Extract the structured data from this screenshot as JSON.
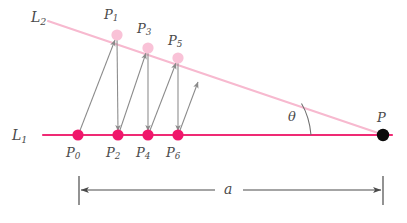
{
  "figure": {
    "background_color": "#ffffff"
  },
  "lines": {
    "baseline": {
      "name": "L",
      "subscript": "1",
      "label": "L",
      "color": "#e8266d",
      "description": "horizontal lower line"
    },
    "slant": {
      "name": "L",
      "subscript": "2",
      "label": "L",
      "color": "#f7b9cf",
      "description": "upper slanted line converging at P"
    }
  },
  "angle": {
    "label": "θ",
    "description": "angle between L1 and L2 at vertex P"
  },
  "vertex": {
    "label": "P",
    "color": "#000000"
  },
  "dimension": {
    "label": "a",
    "description": "distance from P0 to P along the baseline"
  },
  "points_lower": [
    {
      "label": "P",
      "subscript": "0",
      "x": 78,
      "y": 135,
      "color": "#f0176b"
    },
    {
      "label": "P",
      "subscript": "2",
      "x": 118,
      "y": 135,
      "color": "#f0176b"
    },
    {
      "label": "P",
      "subscript": "4",
      "x": 148,
      "y": 135,
      "color": "#f0176b"
    },
    {
      "label": "P",
      "subscript": "6",
      "x": 178,
      "y": 135,
      "color": "#f0176b"
    }
  ],
  "points_upper": [
    {
      "label": "P",
      "subscript": "1",
      "x": 117,
      "y": 35,
      "color": "#f9c2d7"
    },
    {
      "label": "P",
      "subscript": "3",
      "x": 148,
      "y": 48,
      "color": "#f9c2d7"
    },
    {
      "label": "P",
      "subscript": "5",
      "x": 178,
      "y": 58,
      "color": "#f9c2d7"
    }
  ],
  "arrow_color": "#8a8a8a",
  "dimension_color": "#4a4a4a"
}
